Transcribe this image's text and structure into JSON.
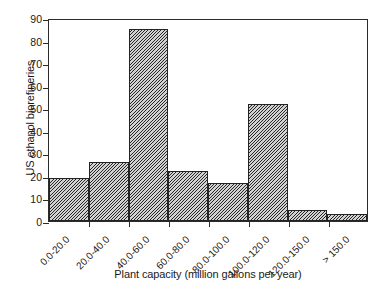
{
  "chart_data": {
    "type": "bar",
    "title": "",
    "xlabel": "Plant capacity (million gallons per year)",
    "ylabel": "US ethanol biorefineries",
    "categories": [
      "0.0-20.0",
      "20.0-40.0",
      "40.0-60.0",
      "60.0-80.0",
      "80.0-100.0",
      "100.0-120.0",
      "120.0-150.0",
      "> 150.0"
    ],
    "values": [
      19,
      26,
      85,
      22,
      17,
      52,
      5,
      3
    ],
    "ylim": [
      0,
      90
    ],
    "yticks": [
      0,
      10,
      20,
      30,
      40,
      50,
      60,
      70,
      80,
      90
    ],
    "ytick_labels": [
      "0",
      "10",
      "20",
      "30",
      "40",
      "50",
      "60",
      "70",
      "80",
      "90"
    ],
    "grid": false,
    "legend": false,
    "legend_position": "none",
    "bar_fill": "diagonal-hatch",
    "bar_fill_color": "#d2d2d2",
    "bar_edge_color": "#232323",
    "background_color": "#ffffff",
    "axis_color": "#2b2b2b",
    "xtick_label_rotation": -45
  }
}
